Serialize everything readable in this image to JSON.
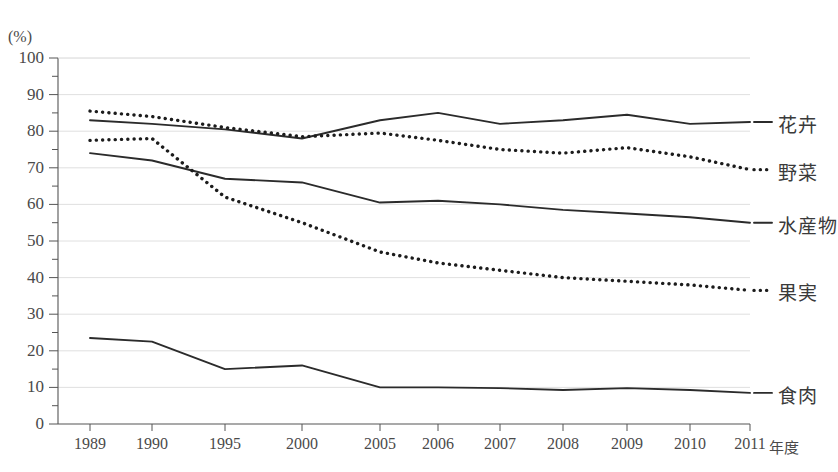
{
  "axis": {
    "unit_label": "(%)",
    "x_unit_label": "年度",
    "y_ticks": [
      "0",
      "10",
      "20",
      "30",
      "40",
      "50",
      "60",
      "70",
      "80",
      "90",
      "100"
    ],
    "x_ticks": [
      "1989",
      "1990",
      "1995",
      "2000",
      "2005",
      "2006",
      "2007",
      "2008",
      "2009",
      "2010",
      "2011"
    ]
  },
  "legend": {
    "items": [
      {
        "label": "花卉"
      },
      {
        "label": "野菜"
      },
      {
        "label": "水産物"
      },
      {
        "label": "果実"
      },
      {
        "label": "食肉"
      }
    ]
  },
  "chart_data": {
    "type": "line",
    "title": "",
    "xlabel": "年度",
    "ylabel": "(%)",
    "ylim": [
      0,
      100
    ],
    "y_major_step": 10,
    "y_minor_step": 5,
    "grid": true,
    "legend_position": "right",
    "categories": [
      "1989",
      "1990",
      "1995",
      "2000",
      "2005",
      "2006",
      "2007",
      "2008",
      "2009",
      "2010",
      "2011"
    ],
    "series": [
      {
        "name": "花卉",
        "style": "solid",
        "color": "#2b2b2b",
        "values": [
          83.0,
          82.0,
          80.5,
          78.0,
          83.0,
          85.0,
          82.0,
          83.0,
          84.5,
          82.0,
          82.5
        ]
      },
      {
        "name": "野菜",
        "style": "dotted",
        "color": "#1c1c1c",
        "values": [
          85.5,
          84.0,
          81.0,
          78.5,
          79.5,
          77.5,
          75.0,
          74.0,
          75.5,
          73.0,
          69.5
        ]
      },
      {
        "name": "水産物",
        "style": "solid",
        "color": "#2b2b2b",
        "values": [
          74.0,
          72.0,
          67.0,
          66.0,
          60.5,
          61.0,
          60.0,
          58.5,
          57.5,
          56.5,
          55.0
        ]
      },
      {
        "name": "果実",
        "style": "dotted",
        "color": "#1c1c1c",
        "values": [
          77.5,
          78.0,
          62.0,
          55.0,
          47.0,
          44.0,
          42.0,
          40.0,
          39.0,
          38.0,
          36.5
        ]
      },
      {
        "name": "食肉",
        "style": "solid",
        "color": "#2b2b2b",
        "values": [
          23.5,
          22.5,
          15.0,
          16.0,
          10.0,
          10.0,
          9.8,
          9.3,
          9.8,
          9.3,
          8.5
        ]
      }
    ]
  }
}
